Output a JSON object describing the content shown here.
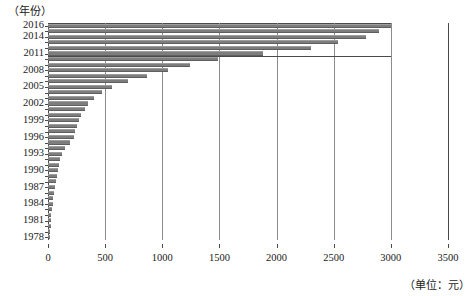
{
  "chart_data": {
    "type": "bar",
    "orientation": "horizontal",
    "title": "",
    "xlabel": "（单位：元）",
    "ylabel": "（年份）",
    "xlim": [
      0,
      3500
    ],
    "grid": true,
    "legend": null,
    "xticks": [
      0,
      500,
      1000,
      1500,
      2000,
      2500,
      3000,
      3500
    ],
    "xticklabels": [
      "0",
      "500",
      "1000",
      "1500",
      "2000",
      "2500",
      "3000",
      "3500"
    ],
    "yticklabels": [
      "2016",
      "2014",
      "2011",
      "2008",
      "2005",
      "2002",
      "1999",
      "1996",
      "1993",
      "1990",
      "1987",
      "1984",
      "1981",
      "1978"
    ],
    "categories": [
      "2016",
      "2015",
      "2014",
      "2013",
      "2012",
      "2011",
      "2010",
      "2009",
      "2008",
      "2007",
      "2006",
      "2005",
      "2004",
      "2003",
      "2002",
      "2001",
      "2000",
      "1999",
      "1998",
      "1997",
      "1996",
      "1995",
      "1994",
      "1993",
      "1992",
      "1991",
      "1990",
      "1989",
      "1988",
      "1987",
      "1986",
      "1985",
      "1984",
      "1983",
      "1982",
      "1981",
      "1980",
      "1979",
      "1978"
    ],
    "values": [
      3000,
      2900,
      2780,
      2540,
      2300,
      1880,
      1490,
      1240,
      1050,
      870,
      700,
      560,
      470,
      400,
      350,
      320,
      290,
      270,
      250,
      240,
      225,
      195,
      150,
      120,
      105,
      95,
      88,
      80,
      72,
      62,
      55,
      48,
      42,
      36,
      30,
      26,
      22,
      18,
      14
    ],
    "bar_color": "#7d7d7d"
  },
  "colors": {
    "bar": "#7d7d7d",
    "grid": "#8c8c8c",
    "axis": "#4a4a4a",
    "background": "#ffffff"
  }
}
